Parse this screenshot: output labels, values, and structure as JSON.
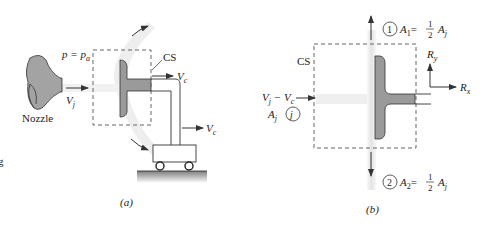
{
  "panel_a": {
    "caption": "(a)",
    "pressure_label": "p = p",
    "pressure_sub": "a",
    "nozzle_label": "Nozzle",
    "jet_velocity": "V",
    "jet_velocity_sub": "j",
    "cs_label": "CS",
    "cart_velocity_top": "V",
    "cart_velocity_top_sub": "c",
    "cart_velocity_mid": "V",
    "cart_velocity_mid_sub": "c",
    "edge_glyph": "g"
  },
  "panel_b": {
    "caption": "(b)",
    "cs_label": "CS",
    "inlet_velocity": "V",
    "inlet_velocity_sub1": "j",
    "inlet_velocity_minus": " − V",
    "inlet_velocity_sub2": "c",
    "inlet_area": "A",
    "inlet_area_sub": "j",
    "inlet_section": "j",
    "section1_num": "1",
    "section1_eq": "A",
    "section1_sub": "1",
    "section1_rhs": "= ",
    "section1_frac_num": "1",
    "section1_frac_den": "2",
    "section1_area": "A",
    "section1_area_sub": "j",
    "section2_num": "2",
    "section2_eq": "A",
    "section2_sub": "2",
    "section2_rhs": "= ",
    "section2_frac_num": "1",
    "section2_frac_den": "2",
    "section2_area": "A",
    "section2_area_sub": "j",
    "reaction_y": "R",
    "reaction_y_sub": "y",
    "reaction_x": "R",
    "reaction_x_sub": "x"
  },
  "colors": {
    "vane_fill": "#9a9a9a",
    "nozzle_fill": "#a0a0a0",
    "ground_fill": "#8c8c8c",
    "jet_shade": "#ececec",
    "line": "#333333",
    "dash": "#555555"
  }
}
